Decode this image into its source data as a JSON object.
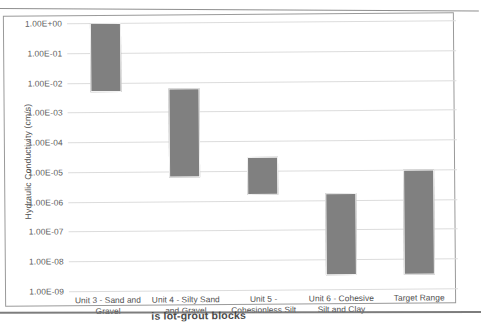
{
  "chart_data": {
    "type": "bar",
    "title": "",
    "xlabel": "",
    "ylabel": "Hydraulic Conductivity (cm/s)",
    "scale": "log",
    "ylim": [
      1e-09,
      1
    ],
    "grid": true,
    "legend": "none",
    "bar_style": "range bars (floating high/low)",
    "tick_labels": [
      "1.00E+00",
      "1.00E-01",
      "1.00E-02",
      "1.00E-03",
      "1.00E-04",
      "1.00E-05",
      "1.00E-06",
      "1.00E-07",
      "1.00E-08",
      "1.00E-09"
    ],
    "tick_values": [
      1,
      0.1,
      0.01,
      0.001,
      0.0001,
      1e-05,
      1e-06,
      1e-07,
      1e-08,
      1e-09
    ],
    "categories": [
      "Unit 3 - Sand and Gravel",
      "Unit 4 - Silty Sand and Gravel",
      "Unit 5 - Cohesionless Silt",
      "Unit 6 - Cohesive Silt and Clay",
      "Target Range"
    ],
    "series": [
      {
        "name": "Hydraulic Conductivity Range",
        "high": [
          1.0,
          0.006,
          3e-05,
          1.7e-06,
          1e-05
        ],
        "low": [
          0.005,
          6e-06,
          1.5e-06,
          3e-09,
          3e-09
        ]
      }
    ],
    "bar_color": "#808080"
  },
  "document": {
    "caption_fragment": "is lot-grout blocks"
  }
}
